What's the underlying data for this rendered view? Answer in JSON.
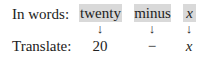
{
  "row_words": {
    "label": "In words:",
    "terms": [
      {
        "text": "twenty"
      },
      {
        "text": "minus"
      },
      {
        "text": "x"
      }
    ]
  },
  "arrows": {
    "glyph": "↓"
  },
  "row_translate": {
    "label": "Translate:",
    "values": [
      {
        "text": "20"
      },
      {
        "text": "−"
      },
      {
        "text": "x"
      }
    ]
  },
  "colors": {
    "highlight": "#d9d9d9",
    "text": "#222222"
  }
}
